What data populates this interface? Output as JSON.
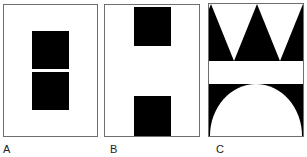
{
  "figure": {
    "panels": [
      {
        "id": "A",
        "label": "A",
        "description": "Two stacked black rectangles centered, separated by a thin white gap"
      },
      {
        "id": "B",
        "label": "B",
        "description": "Two black rectangles at top and bottom edges with white space between"
      },
      {
        "id": "C",
        "label": "C",
        "description": "Row of black downward-pointing regions forming white triangles at top, white band in middle, black band with white semicircle at bottom"
      }
    ]
  },
  "colors": {
    "figure": "#000000",
    "ground": "#ffffff",
    "border": "#6e6e6e"
  }
}
